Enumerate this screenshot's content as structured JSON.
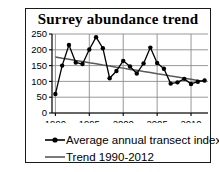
{
  "chart_data": {
    "type": "line",
    "title": "Surrey abundance trend",
    "xlabel": "",
    "ylabel": "",
    "xlim": [
      1989.5,
      2012.5
    ],
    "ylim": [
      0,
      250
    ],
    "grid": true,
    "legend_position": "bottom-left",
    "x": [
      1990,
      1991,
      1992,
      1993,
      1994,
      1995,
      1996,
      1997,
      1998,
      1999,
      2000,
      2001,
      2002,
      2003,
      2004,
      2005,
      2006,
      2007,
      2008,
      2009,
      2010,
      2011,
      2012
    ],
    "xticks": [
      1990,
      1995,
      2000,
      2005,
      2010
    ],
    "xtick_labels": [
      "1990",
      "1995",
      "2000",
      "2005",
      "2010"
    ],
    "yticks": [
      0,
      50,
      100,
      150,
      200,
      250
    ],
    "ytick_labels": [
      "0",
      "50",
      "100",
      "150",
      "200",
      "250"
    ],
    "series": [
      {
        "name": "Average annual transect index",
        "marker": "filled-circle",
        "color": "#000000",
        "values": [
          60,
          150,
          215,
          160,
          155,
          201,
          240,
          205,
          110,
          133,
          165,
          147,
          125,
          157,
          207,
          158,
          140,
          93,
          97,
          108,
          92,
          99,
          103
        ]
      },
      {
        "name": "Trend 1990-2012",
        "marker": "none",
        "color": "#595959",
        "values": [
          177,
          173,
          170,
          166,
          163,
          159,
          156,
          152,
          149,
          145,
          142,
          138,
          135,
          131,
          128,
          124,
          121,
          117,
          114,
          110,
          107,
          103,
          100
        ]
      }
    ]
  },
  "legend": {
    "items": [
      {
        "label": "Average annual transect index",
        "key": "line-with-marker"
      },
      {
        "label": "Trend 1990-2012",
        "key": "plain-line"
      }
    ]
  }
}
